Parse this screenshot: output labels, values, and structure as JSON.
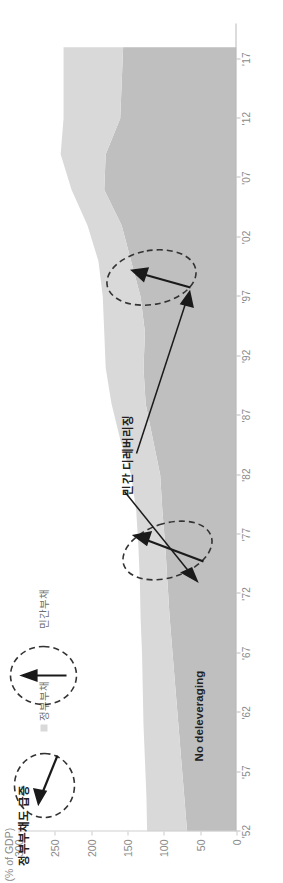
{
  "chart_data": {
    "type": "area",
    "title": "",
    "subtitle": "",
    "xlabel": "",
    "ylabel": "(% of GDP)",
    "ylim": [
      0,
      300
    ],
    "xlim": [
      "'52",
      "'17"
    ],
    "grid": false,
    "legend_position": "top-left",
    "stacked": true,
    "x_tick_labels": [
      "'52",
      "'57",
      "'62",
      "'67",
      "'72",
      "'77",
      "'82",
      "'87",
      "'92",
      "'97",
      "'02",
      "'07",
      "'12",
      "'17"
    ],
    "x_tick_years": [
      1952,
      1957,
      1962,
      1967,
      1972,
      1977,
      1982,
      1987,
      1992,
      1997,
      2002,
      2007,
      2012,
      2017
    ],
    "y_tick_labels": [
      "0",
      "50",
      "100",
      "150",
      "200",
      "250",
      "300"
    ],
    "y_tick_values": [
      0,
      50,
      100,
      150,
      200,
      250,
      300
    ],
    "colors": {
      "government_debt": "#d9d9d9",
      "private_debt": "#bfbfbf",
      "axis": "#b9b9b9",
      "tick_text": "#8a8a8a",
      "annotation_text": "#222222",
      "annotation_shape": "#333333"
    },
    "x": [
      1952,
      1955,
      1958,
      1961,
      1964,
      1967,
      1970,
      1973,
      1976,
      1979,
      1982,
      1985,
      1988,
      1991,
      1994,
      1997,
      2000,
      2003,
      2006,
      2009,
      2012,
      2015,
      2018
    ],
    "series": [
      {
        "name": "정부부채",
        "key": "government_debt",
        "color": "#d9d9d9",
        "values": [
          55,
          52,
          50,
          48,
          45,
          42,
          40,
          38,
          37,
          36,
          40,
          45,
          47,
          52,
          56,
          52,
          45,
          47,
          45,
          62,
          78,
          80,
          82
        ]
      },
      {
        "name": "민간부채",
        "key": "private_debt",
        "color": "#bfbfbf",
        "values": [
          68,
          72,
          76,
          80,
          84,
          88,
          92,
          95,
          98,
          102,
          105,
          115,
          125,
          128,
          126,
          132,
          145,
          158,
          182,
          180,
          160,
          158,
          156
        ]
      }
    ],
    "total_values": [
      123,
      124,
      126,
      128,
      129,
      130,
      132,
      133,
      135,
      138,
      145,
      160,
      172,
      180,
      182,
      184,
      190,
      205,
      227,
      242,
      238,
      238,
      238
    ],
    "annotations": [
      {
        "id": "gov-surge",
        "text": "정부부채도 급증",
        "shape": "dashed-ellipse-with-arrow",
        "near_year": 2012
      },
      {
        "id": "no-deleveraging",
        "text": "No deleveraging",
        "shape": "dashed-ellipse-with-up-arrow",
        "near_year": 2015
      },
      {
        "id": "private-deleveraging",
        "text": "민간 디레버리징",
        "shape": "two-dashed-ellipses-with-arrows",
        "near_years": [
          1991,
          2009
        ]
      }
    ]
  },
  "legend": {
    "government": {
      "label": "정부부채",
      "color": "#d9d9d9"
    },
    "private": {
      "label": "민간부채",
      "color": "#bfbfbf"
    }
  },
  "axes": {
    "y_title": "(% of GDP)",
    "x_ticks": [
      "'52",
      "'57",
      "'62",
      "'67",
      "'72",
      "'77",
      "'82",
      "'87",
      "'92",
      "'97",
      "'02",
      "'07",
      "'12",
      "'17"
    ],
    "y_ticks": [
      "0",
      "50",
      "100",
      "150",
      "200",
      "250",
      "300"
    ]
  },
  "annotations": {
    "gov_surge": "정부부채도 급증",
    "no_deleveraging": "No deleveraging",
    "private_deleveraging": "민간 디레버리징"
  }
}
